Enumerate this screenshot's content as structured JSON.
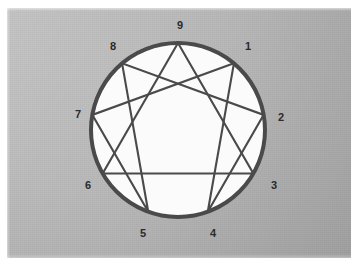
{
  "figure": {
    "background_color": "#b2b2b2",
    "plate": {
      "x": 7,
      "y": 8,
      "width": 344,
      "height": 250
    }
  },
  "symbol": {
    "name": "enneagram",
    "circle": {
      "center_x": 178,
      "center_y": 130,
      "radius": 87,
      "stroke_color": "#4a4a4a",
      "stroke_width": 4,
      "fill_color": "#fbfbfb"
    },
    "inner_stroke_color": "#4a4a4a",
    "inner_stroke_width": 2.1,
    "points": [
      {
        "number": "1",
        "angle_deg": -50,
        "label_x": 248,
        "label_y": 47
      },
      {
        "number": "2",
        "angle_deg": -10,
        "label_x": 281,
        "label_y": 118
      },
      {
        "number": "3",
        "angle_deg": 30,
        "label_x": 274,
        "label_y": 186
      },
      {
        "number": "4",
        "angle_deg": 70,
        "label_x": 213,
        "label_y": 234
      },
      {
        "number": "5",
        "angle_deg": 110,
        "label_x": 143,
        "label_y": 234
      },
      {
        "number": "6",
        "angle_deg": 150,
        "label_x": 88,
        "label_y": 186
      },
      {
        "number": "7",
        "angle_deg": 190,
        "label_x": 78,
        "label_y": 115
      },
      {
        "number": "8",
        "angle_deg": 230,
        "label_x": 113,
        "label_y": 47
      },
      {
        "number": "9",
        "angle_deg": 270,
        "label_x": 180,
        "label_y": 26
      }
    ],
    "triangle_path": [
      "9",
      "3",
      "6",
      "9"
    ],
    "hexad_path": [
      "1",
      "4",
      "2",
      "8",
      "5",
      "7",
      "1"
    ]
  }
}
